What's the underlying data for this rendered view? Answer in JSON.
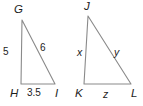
{
  "figure": {
    "type": "similar-triangles-diagram",
    "background_color": "#ffffff",
    "stroke_color": "#8a8a8a",
    "text_color": "#1c1c1c",
    "width": 143,
    "height": 106
  },
  "triangle_left": {
    "name": "GHI",
    "vertices": [
      {
        "label": "G",
        "x": 22,
        "y": 20,
        "label_x": 14,
        "label_y": 4
      },
      {
        "label": "H",
        "x": 21,
        "y": 84,
        "label_x": 10,
        "label_y": 88
      },
      {
        "label": "I",
        "x": 55,
        "y": 84,
        "label_x": 55,
        "label_y": 88
      }
    ],
    "sides": [
      {
        "label": "5",
        "between": "G-H",
        "label_x": 3,
        "label_y": 47
      },
      {
        "label": "6",
        "between": "G-I",
        "label_x": 40,
        "label_y": 43
      },
      {
        "label": "3.5",
        "between": "H-I",
        "label_x": 27,
        "label_y": 88
      }
    ]
  },
  "triangle_right": {
    "name": "JKL",
    "vertices": [
      {
        "label": "J",
        "x": 88,
        "y": 16,
        "label_x": 84,
        "label_y": 1
      },
      {
        "label": "K",
        "x": 84,
        "y": 84,
        "label_x": 75,
        "label_y": 88
      },
      {
        "label": "L",
        "x": 131,
        "y": 84,
        "label_x": 131,
        "label_y": 88
      }
    ],
    "sides": [
      {
        "label": "x",
        "between": "J-K",
        "label_x": 77,
        "label_y": 47
      },
      {
        "label": "y",
        "between": "J-L",
        "label_x": 114,
        "label_y": 47
      },
      {
        "label": "z",
        "between": "K-L",
        "label_x": 103,
        "label_y": 89
      }
    ]
  }
}
